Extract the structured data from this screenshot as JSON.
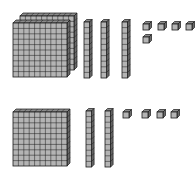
{
  "diagram": {
    "colors": {
      "face": "#b4b4b4",
      "side": "#6a6a6a",
      "top": "#8a8a8a",
      "line": "#1a1a1a"
    },
    "groups": [
      {
        "name": "top-number",
        "hundreds": 2,
        "tens": 3,
        "ones": 5
      },
      {
        "name": "bottom-number",
        "hundreds": 1,
        "tens": 2,
        "ones": 4
      }
    ]
  }
}
